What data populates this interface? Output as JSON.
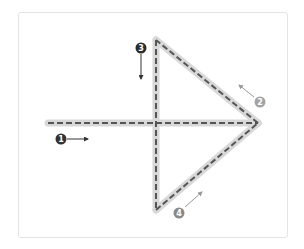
{
  "diagram": {
    "colors": {
      "background": "#ffffff",
      "frame_border": "#e4e4e4",
      "stroke_band": "#d8d8d8",
      "dash_line": "#555555"
    },
    "strokes": [
      {
        "id": 1,
        "label": "1",
        "description": "Horizontal shaft, left to right",
        "from": [
          48,
          123
        ],
        "to": [
          258,
          123
        ],
        "badge": {
          "x": 61,
          "y": 139,
          "color": "#333333"
        },
        "direction_arrow": {
          "from": [
            67,
            139
          ],
          "to": [
            88,
            139
          ]
        }
      },
      {
        "id": 2,
        "label": "2",
        "description": "Upper diagonal, tip to top",
        "from": [
          258,
          123
        ],
        "to": [
          156,
          40
        ],
        "badge": {
          "x": 260,
          "y": 102,
          "color": "#a3a3a3"
        },
        "direction_arrow": {
          "from": [
            254,
            97
          ],
          "to": [
            239,
            85
          ]
        }
      },
      {
        "id": 3,
        "label": "3",
        "description": "Vertical line, top to bottom",
        "from": [
          156,
          40
        ],
        "to": [
          156,
          210
        ],
        "badge": {
          "x": 141,
          "y": 48,
          "color": "#2b2b2b"
        },
        "direction_arrow": {
          "from": [
            141,
            54
          ],
          "to": [
            141,
            79
          ]
        }
      },
      {
        "id": 4,
        "label": "4",
        "description": "Lower diagonal, bottom to tip",
        "from": [
          156,
          210
        ],
        "to": [
          258,
          123
        ],
        "badge": {
          "x": 179,
          "y": 213,
          "color": "#8a8a8a"
        },
        "direction_arrow": {
          "from": [
            185,
            207
          ],
          "to": [
            202,
            192
          ]
        }
      }
    ]
  }
}
